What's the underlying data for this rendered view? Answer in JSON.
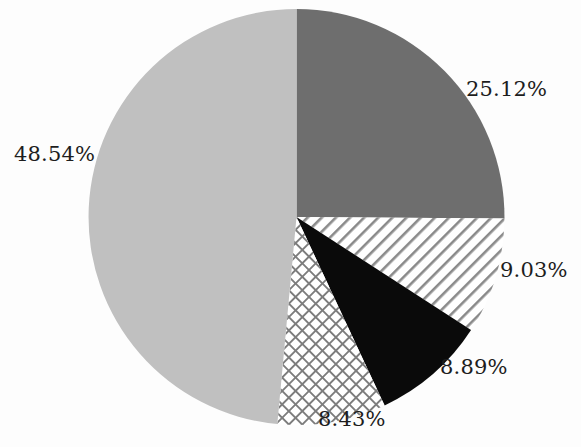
{
  "figure": {
    "name": "pie-chart",
    "background_color": "#fdfdfd",
    "label_color": "#1d1d1d"
  },
  "chart_data": {
    "type": "pie",
    "title": "",
    "subtitle": "",
    "xlabel": "",
    "ylabel": "",
    "legend_position": "none",
    "grid": false,
    "start_angle_deg": 0,
    "direction": "clockwise",
    "categories": [
      "25.12%",
      "9.03%",
      "8.89%",
      "8.43%",
      "48.54%"
    ],
    "values": [
      25.12,
      9.03,
      8.89,
      8.43,
      48.54
    ],
    "total": 100.01,
    "slices": [
      {
        "label": "25.12%",
        "value": 25.12,
        "fill_style": "solid",
        "color": "#6e6e6e",
        "start_deg": 0,
        "end_deg": 90.43,
        "label_position": "right-top"
      },
      {
        "label": "9.03%",
        "value": 9.03,
        "fill_style": "diagonal-stripes",
        "color": "#8a8a8a",
        "start_deg": 90.43,
        "end_deg": 122.94,
        "label_position": "right"
      },
      {
        "label": "8.89%",
        "value": 8.89,
        "fill_style": "solid",
        "color": "#0a0a0a",
        "start_deg": 122.94,
        "end_deg": 154.94,
        "label_position": "right-bottom"
      },
      {
        "label": "8.43%",
        "value": 8.43,
        "fill_style": "crosshatch",
        "color": "#7d7d7d",
        "start_deg": 154.94,
        "end_deg": 185.29,
        "label_position": "bottom"
      },
      {
        "label": "48.54%",
        "value": 48.54,
        "fill_style": "solid",
        "color": "#c0c0c0",
        "start_deg": 185.29,
        "end_deg": 360,
        "label_position": "left"
      }
    ]
  }
}
